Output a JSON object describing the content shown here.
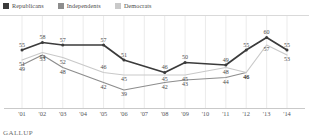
{
  "legend": {
    "items": [
      {
        "label": "Republicans",
        "color": "#3b3b3b"
      },
      {
        "label": "Independents",
        "color": "#8d8d8d"
      },
      {
        "label": "Democrats",
        "color": "#c9c9c9"
      }
    ]
  },
  "footer": {
    "brand": "GALLUP"
  },
  "chart_data": {
    "type": "line",
    "title": "",
    "subtitle": "",
    "xlabel": "",
    "ylabel": "",
    "grid": "vertical",
    "legend_position": "top-left",
    "ylim": [
      35,
      63
    ],
    "categories": [
      "'01",
      "'02",
      "'03",
      "'04",
      "'05",
      "'06",
      "'07",
      "'08",
      "'09",
      "'10",
      "'11",
      "'12",
      "'13",
      "'14"
    ],
    "series": [
      {
        "name": "Republicans",
        "color": "#3b3b3b",
        "values": [
          55,
          58,
          57,
          null,
          57,
          51,
          null,
          46,
          50,
          null,
          49,
          55,
          60,
          55
        ],
        "label_pos": [
          "above",
          "above",
          "above",
          null,
          "above",
          "above",
          null,
          "above",
          "above",
          null,
          "above",
          "above",
          "above",
          "above"
        ]
      },
      {
        "name": "Democrats",
        "color": "#c9c9c9",
        "values": [
          51,
          54,
          52,
          null,
          46,
          45,
          null,
          45,
          45,
          null,
          48,
          46,
          57,
          53
        ],
        "label_pos": [
          "below",
          "below",
          "below",
          null,
          "above",
          "below",
          null,
          "below",
          "below",
          null,
          "below",
          "below",
          "below",
          "below"
        ]
      },
      {
        "name": "Independents",
        "color": "#8d8d8d",
        "values": [
          49,
          53,
          48,
          null,
          42,
          39,
          null,
          42,
          43,
          null,
          44,
          46,
          null,
          null
        ],
        "label_pos": [
          "below",
          "below",
          "below",
          null,
          "below",
          "below",
          null,
          "below",
          "below",
          null,
          "below",
          "below",
          null,
          null
        ]
      }
    ]
  }
}
